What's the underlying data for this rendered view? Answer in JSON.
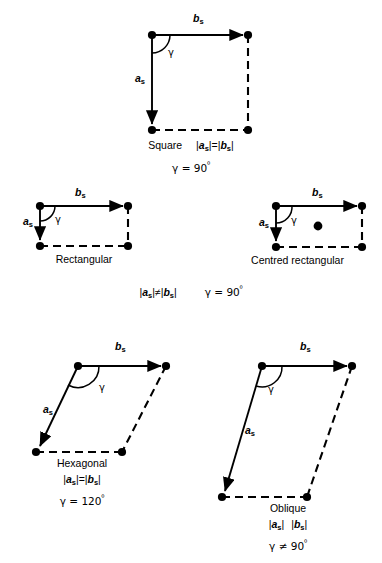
{
  "figure": {
    "vector_a_label": "a",
    "vector_b_label": "b",
    "vector_subscript": "s",
    "angle_label": "γ",
    "line_color": "#000000",
    "background_color": "#ffffff"
  },
  "lattices": [
    {
      "id": "square",
      "name": "Square",
      "condition": "| a s |=| b s |",
      "angle_condition": "γ = 90º",
      "angle_value": 90,
      "equality": "=",
      "centred": false
    },
    {
      "id": "rectangular",
      "name": "Rectangular",
      "condition": "| a s |≠| b s |",
      "angle_condition": "γ = 90º",
      "angle_value": 90,
      "equality": "≠",
      "centred": false
    },
    {
      "id": "centred-rectangular",
      "name": "Centred rectangular",
      "condition": "| a s |≠| b s |",
      "angle_condition": "γ = 90º",
      "angle_value": 90,
      "equality": "≠",
      "centred": true
    },
    {
      "id": "hexagonal",
      "name": "Hexagonal",
      "condition": "| a s |=| b s |",
      "angle_condition": "γ = 120º",
      "angle_value": 120,
      "equality": "=",
      "centred": false
    },
    {
      "id": "oblique",
      "name": "Oblique",
      "condition": "| a s | | b s |",
      "angle_condition": "γ ≠ 90º",
      "angle_value": null,
      "equality": "",
      "centred": false
    }
  ],
  "captions": {
    "square_name": "Square",
    "square_mag": "=",
    "square_angle_eq": "γ = 90",
    "square_deg": "º",
    "rectangular_name": "Rectangular",
    "centred_name": "Centred rectangular",
    "middle_mag": "≠",
    "middle_angle_eq": "γ = 90",
    "middle_deg": "º",
    "hexagonal_name": "Hexagonal",
    "hexagonal_mag": "=",
    "hexagonal_angle_eq": "γ = 120",
    "hexagonal_deg": "º",
    "oblique_name": "Oblique",
    "oblique_mag": "",
    "oblique_angle_eq": "γ ≠ 90",
    "oblique_deg": "º",
    "bar": "|"
  },
  "labels": {
    "a_vector": "a",
    "b_vector": "b",
    "sub_s": "s",
    "gamma": "γ"
  }
}
